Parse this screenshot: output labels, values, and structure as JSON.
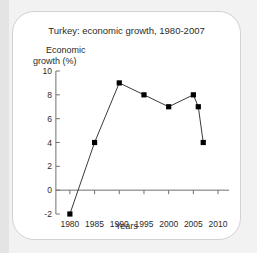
{
  "card": {
    "title": "Turkey: economic growth, 1980-2007",
    "y_axis_label_line1": "Economic",
    "y_axis_label_line2": "growth (%)",
    "x_axis_label": "Years"
  },
  "colors": {
    "page_background": "#f2f2f2",
    "left_band": "#e4e4e4",
    "card_background": "#ffffff",
    "card_border": "#d2d2d2",
    "text": "#2b2b2b",
    "axis": "#707070",
    "series_line": "#3a3a3a",
    "marker": "#000000"
  },
  "chart_data": {
    "type": "line",
    "title": "Turkey: economic growth, 1980-2007",
    "xlabel": "Years",
    "ylabel": "Economic growth (%)",
    "xlim": [
      1978,
      2011
    ],
    "ylim": [
      -2,
      10
    ],
    "xticks": [
      1980,
      1985,
      1990,
      1995,
      2000,
      2005,
      2010
    ],
    "xtick_labels": [
      "1980",
      "1985",
      "1990",
      "1995",
      "2000",
      "2005",
      "2010"
    ],
    "yticks": [
      -2,
      0,
      2,
      4,
      6,
      8,
      10
    ],
    "ytick_labels": [
      "-2",
      "0",
      "2",
      "4",
      "6",
      "8",
      "10"
    ],
    "grid": false,
    "legend": false,
    "marker": "square",
    "x": [
      1980,
      1985,
      1990,
      1995,
      2000,
      2005,
      2006,
      2007
    ],
    "values": [
      -2,
      4,
      9,
      8,
      7,
      8,
      7,
      4
    ],
    "series": [
      {
        "name": "Economic growth (%)",
        "x": [
          1980,
          1985,
          1990,
          1995,
          2000,
          2005,
          2006,
          2007
        ],
        "values": [
          -2,
          4,
          9,
          8,
          7,
          8,
          7,
          4
        ]
      }
    ]
  }
}
